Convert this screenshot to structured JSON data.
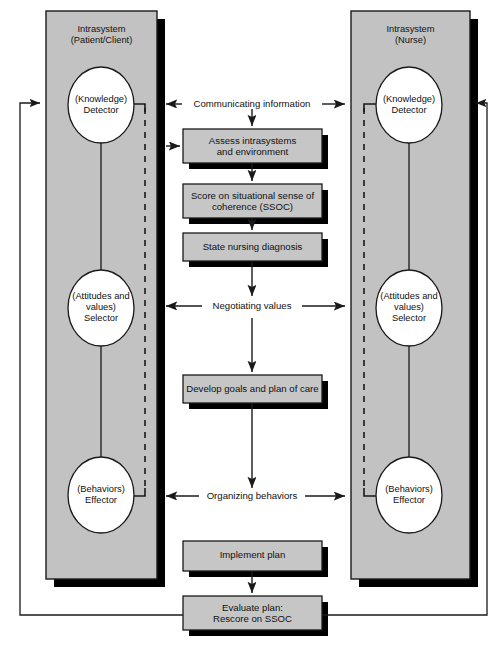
{
  "diagram": {
    "type": "flow-diagram",
    "colors": {
      "panel_fill": "#c2c2c2",
      "box_fill": "#c6c6c6",
      "shadow": "#000000",
      "stroke": "#1a1a1a",
      "ellipse_fill": "#ffffff",
      "background": "#ffffff"
    }
  },
  "panels": [
    {
      "id": "patient",
      "title_line1": "Intrasystem",
      "title_line2": "(Patient/Client)",
      "nodes": [
        {
          "id": "knowledge",
          "line1": "(Knowledge)",
          "line2": "Detector",
          "line3": ""
        },
        {
          "id": "attitudes",
          "line1": "(Attitudes and",
          "line2": "values)",
          "line3": "Selector"
        },
        {
          "id": "behaviors",
          "line1": "(Behaviors)",
          "line2": "Effector",
          "line3": ""
        }
      ]
    },
    {
      "id": "nurse",
      "title_line1": "Intrasystem",
      "title_line2": "(Nurse)",
      "nodes": [
        {
          "id": "knowledge",
          "line1": "(Knowledge)",
          "line2": "Detector",
          "line3": ""
        },
        {
          "id": "attitudes",
          "line1": "(Attitudes and",
          "line2": "values)",
          "line3": "Selector"
        },
        {
          "id": "behaviors",
          "line1": "(Behaviors)",
          "line2": "Effector",
          "line3": ""
        }
      ]
    }
  ],
  "exchange_labels": [
    {
      "id": "communicating",
      "text": "Communicating information"
    },
    {
      "id": "negotiating",
      "text": "Negotiating values"
    },
    {
      "id": "organizing",
      "text": "Organizing behaviors"
    }
  ],
  "process_boxes": [
    {
      "id": "assess",
      "line1": "Assess intrasystems",
      "line2": "and environment"
    },
    {
      "id": "score",
      "line1": "Score on situational sense of",
      "line2": "coherence (SSOC)"
    },
    {
      "id": "diagnosis",
      "line1": "State nursing diagnosis",
      "line2": ""
    },
    {
      "id": "develop",
      "line1": "Develop goals and plan of care",
      "line2": ""
    },
    {
      "id": "implement",
      "line1": "Implement plan",
      "line2": ""
    },
    {
      "id": "evaluate",
      "line1": "Evaluate plan:",
      "line2": "Rescore on SSOC"
    }
  ]
}
